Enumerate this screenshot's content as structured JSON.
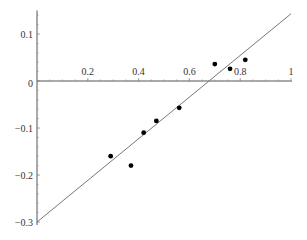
{
  "chart_data": {
    "type": "scatter",
    "title": "",
    "xlabel": "",
    "ylabel": "",
    "xlim": [
      0,
      1
    ],
    "ylim": [
      -0.3,
      0.15
    ],
    "grid": false,
    "legend": "none",
    "x_ticks": [
      {
        "value": 0.2,
        "label": "0.2"
      },
      {
        "value": 0.4,
        "label": "0.4"
      },
      {
        "value": 0.6,
        "label": "0.6"
      },
      {
        "value": 0.8,
        "label": "0.8"
      },
      {
        "value": 1,
        "label": "1"
      }
    ],
    "y_ticks": [
      {
        "value": 0.1,
        "label": "0.1"
      },
      {
        "value": 0,
        "label": "0"
      },
      {
        "value": -0.1,
        "label": "-0.1"
      },
      {
        "value": -0.2,
        "label": "-0.2"
      },
      {
        "value": -0.3,
        "label": "-0.3"
      }
    ],
    "series": [
      {
        "name": "data points",
        "type": "scatter",
        "color": "#000000",
        "x": [
          0.29,
          0.37,
          0.42,
          0.47,
          0.56,
          0.7,
          0.76,
          0.82
        ],
        "y": [
          -0.16,
          -0.18,
          -0.11,
          -0.085,
          -0.057,
          0.036,
          0.026,
          0.045
        ]
      },
      {
        "name": "fitted line",
        "type": "line",
        "color": "#777777",
        "x": [
          0,
          1
        ],
        "y": [
          -0.3,
          0.143
        ]
      }
    ]
  }
}
